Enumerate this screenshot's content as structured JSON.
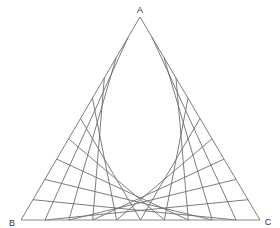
{
  "diagram": {
    "type": "ternary-grid",
    "divisions": 10,
    "vertices": {
      "top": {
        "label": "A",
        "x": 140,
        "y": 17
      },
      "left": {
        "label": "B",
        "x": 21,
        "y": 220
      },
      "right": {
        "label": "C",
        "x": 260,
        "y": 220
      }
    },
    "line_color": "#6e6e6e",
    "base_color": "#8a8a8a",
    "label_color": "#333333"
  }
}
